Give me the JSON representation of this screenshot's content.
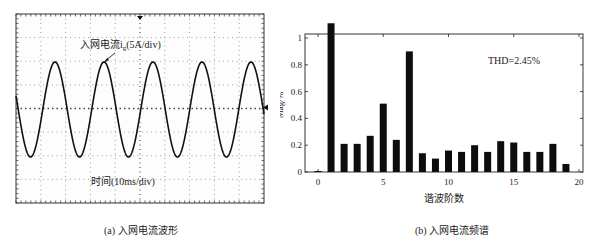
{
  "scope": {
    "annotation": "入网电流i",
    "annotation_sub": "g",
    "annotation_scale": "(5A/div)",
    "time_label": "时间(10ms/div)",
    "caption": "(a) 入网电流波形",
    "frame": {
      "x": 16,
      "y": 14,
      "w": 248,
      "h": 189
    },
    "divisions": {
      "x": 10,
      "y": 8
    },
    "waveform": {
      "center_y": 109.5,
      "amplitude_px": 47.5,
      "period_px": 49,
      "first_peak_x": 55,
      "cycles_visible": 5.1
    }
  },
  "spectrum": {
    "thd_label": "THD=2.45%",
    "ylabel": "Mag/%",
    "xlabel": "谐波阶数",
    "caption": "(b) 入网电流频谱"
  },
  "chart_data": [
    {
      "type": "line",
      "title": "入网电流波形",
      "subtitle": "(a) 入网电流波形",
      "xlabel": "时间(10ms/div)",
      "ylabel": "入网电流 ig (5A/div)",
      "description": "Oscilloscope capture of sinusoidal grid-injected current, approx. 5 cycles across 10 horizontal divisions (10ms/div) → ~20ms period (50Hz); peak ≈ 2 divisions ≈ 10A",
      "x_divisions": 10,
      "y_divisions": 8,
      "time_per_div_ms": 10,
      "current_per_div_A": 5,
      "period_ms": 20,
      "peak_amplitude_A": 10,
      "grid": true
    },
    {
      "type": "bar",
      "title": "入网电流频谱",
      "subtitle": "(b) 入网电流频谱",
      "xlabel": "谐波阶数",
      "ylabel": "Mag/%",
      "annotation": "THD=2.45%",
      "categories": [
        1,
        2,
        3,
        4,
        5,
        6,
        7,
        8,
        9,
        10,
        11,
        12,
        13,
        14,
        15,
        16,
        17,
        18,
        19
      ],
      "values": [
        1.11,
        0.21,
        0.21,
        0.27,
        0.51,
        0.24,
        0.9,
        0.14,
        0.1,
        0.16,
        0.15,
        0.2,
        0.15,
        0.23,
        0.22,
        0.15,
        0.15,
        0.21,
        0.06
      ],
      "xlim": [
        -1,
        20
      ],
      "ylim": [
        0,
        1.05
      ],
      "xticks": [
        0,
        5,
        10,
        15,
        20
      ],
      "yticks": [
        0,
        0.2,
        0.4,
        0.6,
        0.8,
        1
      ],
      "ytick_labels": [
        "0",
        "0.2",
        "0.4",
        "0.6",
        "0.8",
        "1"
      ],
      "grid": false,
      "legend": null
    }
  ]
}
